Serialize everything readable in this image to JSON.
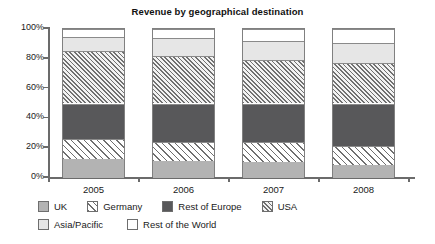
{
  "chart_data": {
    "type": "bar",
    "title": "Revenue by geographical destination",
    "subtitle": "",
    "xlabel": "",
    "ylabel": "",
    "categories": [
      "2005",
      "2006",
      "2007",
      "2008"
    ],
    "ytick_labels": [
      "0%",
      "20%",
      "40%",
      "60%",
      "80%",
      "100%"
    ],
    "ytick_values": [
      0,
      20,
      40,
      60,
      80,
      100
    ],
    "ylim": [
      0,
      100
    ],
    "stacked": true,
    "grid": false,
    "legend_position": "bottom",
    "series": [
      {
        "name": "UK",
        "key": "uk",
        "color": "#b3b3b3",
        "pattern": "solid",
        "values": [
          12.5,
          11.5,
          11.0,
          9.0
        ]
      },
      {
        "name": "Germany",
        "key": "de",
        "color": "#ffffff",
        "pattern": "diagonal-sparse",
        "values": [
          13.5,
          12.5,
          13.0,
          12.5
        ]
      },
      {
        "name": "Rest of Europe",
        "key": "roe",
        "color": "#58585a",
        "pattern": "solid",
        "values": [
          24.0,
          26.0,
          26.0,
          28.5
        ]
      },
      {
        "name": "USA",
        "key": "usa",
        "color": "#f2f2f2",
        "pattern": "diagonal-dense",
        "values": [
          35.0,
          32.0,
          29.5,
          27.5
        ]
      },
      {
        "name": "Asia/Pacific",
        "key": "ap",
        "color": "#e6e6e6",
        "pattern": "solid",
        "values": [
          9.5,
          12.0,
          12.5,
          13.0
        ]
      },
      {
        "name": "Rest of the World",
        "key": "row",
        "color": "#ffffff",
        "pattern": "solid",
        "values": [
          5.5,
          6.0,
          8.0,
          9.5
        ]
      }
    ],
    "stack_boundaries": {
      "2005": [
        0,
        12.5,
        26.0,
        50.0,
        85.0,
        94.5,
        100
      ],
      "2006": [
        0,
        11.5,
        24.0,
        50.0,
        82.0,
        94.0,
        100
      ],
      "2007": [
        0,
        11.0,
        24.0,
        50.0,
        79.5,
        92.0,
        100
      ],
      "2008": [
        0,
        9.0,
        21.5,
        50.0,
        77.5,
        90.5,
        100
      ]
    }
  },
  "legend": {
    "row1": [
      {
        "label": "UK",
        "key": "uk"
      },
      {
        "label": "Germany",
        "key": "de"
      },
      {
        "label": "Rest of Europe",
        "key": "roe"
      },
      {
        "label": "USA",
        "key": "usa"
      }
    ],
    "row2": [
      {
        "label": "Asia/Pacific",
        "key": "ap"
      },
      {
        "label": "Rest of the World",
        "key": "row"
      }
    ]
  }
}
